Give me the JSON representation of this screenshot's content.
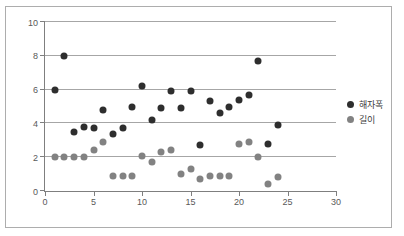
{
  "chart_data": {
    "type": "scatter",
    "title": "",
    "xlabel": "",
    "ylabel": "",
    "xlim": [
      0,
      30
    ],
    "ylim": [
      0,
      10
    ],
    "x_ticks": [
      0,
      5,
      10,
      15,
      20,
      25,
      30
    ],
    "y_ticks": [
      0,
      2,
      4,
      6,
      8,
      10
    ],
    "grid": "horizontal",
    "legend_position": "right",
    "colors": {
      "series1": "#2e2e2e",
      "series2": "#828282",
      "gridline": "#a6a6a6",
      "axis": "#7f7f7f",
      "tick_label": "#595959",
      "frame_border": "#adadad"
    },
    "series": [
      {
        "name": "해자폭",
        "color": "#2e2e2e",
        "points": [
          [
            1,
            6
          ],
          [
            2,
            8
          ],
          [
            3,
            3.5
          ],
          [
            4,
            3.8
          ],
          [
            5,
            3.7
          ],
          [
            6,
            4.8
          ],
          [
            7,
            3.4
          ],
          [
            8,
            3.7
          ],
          [
            9,
            5
          ],
          [
            10,
            6.2
          ],
          [
            11,
            4.2
          ],
          [
            12,
            4.9
          ],
          [
            13,
            5.9
          ],
          [
            14,
            4.9
          ],
          [
            15,
            5.9
          ],
          [
            16,
            2.7
          ],
          [
            17,
            5.3
          ],
          [
            18,
            4.6
          ],
          [
            19,
            5
          ],
          [
            20,
            5.4
          ],
          [
            21,
            5.7
          ],
          [
            22,
            7.7
          ],
          [
            23,
            2.8
          ],
          [
            24,
            3.9
          ]
        ]
      },
      {
        "name": "길이",
        "color": "#828282",
        "points": [
          [
            1,
            2
          ],
          [
            2,
            2
          ],
          [
            3,
            2
          ],
          [
            4,
            2
          ],
          [
            5,
            2.4
          ],
          [
            6,
            2.9
          ],
          [
            7,
            0.9
          ],
          [
            8,
            0.9
          ],
          [
            9,
            0.9
          ],
          [
            10,
            2.1
          ],
          [
            11,
            1.7
          ],
          [
            12,
            2.3
          ],
          [
            13,
            2.4
          ],
          [
            14,
            1
          ],
          [
            15,
            1.3
          ],
          [
            16,
            0.7
          ],
          [
            17,
            0.9
          ],
          [
            18,
            0.9
          ],
          [
            19,
            0.9
          ],
          [
            20,
            2.8
          ],
          [
            21,
            2.9
          ],
          [
            22,
            2
          ],
          [
            23,
            0.4
          ],
          [
            24,
            0.8
          ]
        ]
      }
    ]
  }
}
